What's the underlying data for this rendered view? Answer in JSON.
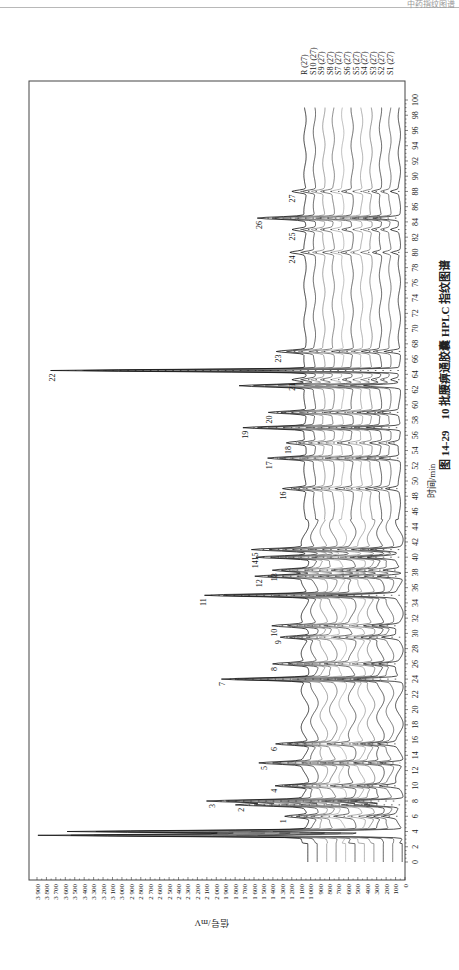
{
  "page": {
    "header_text": "中药指纹图谱"
  },
  "figure": {
    "number": "图 14-29",
    "caption": "10 批腰痹通胶囊 HPLC 指纹图谱"
  },
  "chart_data": {
    "type": "line",
    "orientation": "rotated-90-ccw",
    "title": "10 批腰痹通胶囊 HPLC 指纹图谱",
    "xlabel": "时间/min",
    "ylabel": "信号/mV",
    "xlim": [
      0,
      100
    ],
    "ylim": [
      0,
      3900
    ],
    "x_ticks": [
      0,
      2,
      4,
      6,
      8,
      10,
      12,
      14,
      16,
      18,
      20,
      22,
      24,
      26,
      28,
      30,
      32,
      34,
      36,
      38,
      40,
      42,
      44,
      46,
      48,
      50,
      52,
      54,
      56,
      58,
      60,
      62,
      64,
      66,
      68,
      70,
      72,
      74,
      76,
      78,
      80,
      82,
      84,
      86,
      88,
      90,
      92,
      94,
      96,
      98,
      100
    ],
    "y_ticks": [
      0,
      100,
      200,
      300,
      400,
      500,
      600,
      700,
      800,
      900,
      1000,
      1100,
      1200,
      1300,
      1400,
      1500,
      1600,
      1700,
      1800,
      1900,
      2000,
      2100,
      2200,
      2300,
      2400,
      2500,
      2600,
      2700,
      2800,
      2900,
      3000,
      3100,
      3200,
      3300,
      3400,
      3500,
      3600,
      3700,
      3800,
      3900
    ],
    "y_tick_labels": [
      "0",
      "100",
      "200",
      "300",
      "400",
      "500",
      "600",
      "700",
      "800",
      "900",
      "1 000",
      "1 100",
      "1 200",
      "1 300",
      "1 400",
      "1 500",
      "1 600",
      "1 700",
      "1 800",
      "1 900",
      "2 000",
      "2 100",
      "2 200",
      "2 300",
      "2 400",
      "2 500",
      "2 600",
      "2 700",
      "2 800",
      "2 900",
      "3 000",
      "3 100",
      "3 200",
      "3 300",
      "3 400",
      "3 500",
      "3 600",
      "3 700",
      "3 800",
      "3 900"
    ],
    "grid": false,
    "legend_position": "top-right (stacked trace labels)",
    "series": [
      {
        "name": "S1 (27)",
        "offset": 0
      },
      {
        "name": "S2 (27)",
        "offset": 100
      },
      {
        "name": "S3 (27)",
        "offset": 200
      },
      {
        "name": "S4 (27)",
        "offset": 300
      },
      {
        "name": "S5 (27)",
        "offset": 400
      },
      {
        "name": "S6 (27)",
        "offset": 500
      },
      {
        "name": "S7 (27)",
        "offset": 600
      },
      {
        "name": "S8 (27)",
        "offset": 700
      },
      {
        "name": "S9 (27)",
        "offset": 800
      },
      {
        "name": "S10 (27)",
        "offset": 900
      },
      {
        "name": "R (27)",
        "offset": 1000
      }
    ],
    "baseline_mV": 1000,
    "unlabeled_peaks": [
      {
        "time": 3.5,
        "height": 3800
      },
      {
        "time": 4.0,
        "height": 3500
      },
      {
        "time": 62.5,
        "height": 1700
      }
    ],
    "peaks": [
      {
        "label": "1",
        "time": 6.0,
        "height": 1250
      },
      {
        "label": "2",
        "time": 7.5,
        "height": 1700
      },
      {
        "label": "3",
        "time": 8.0,
        "height": 2000
      },
      {
        "label": "4",
        "time": 10.0,
        "height": 1350
      },
      {
        "label": "5",
        "time": 13.0,
        "height": 1450
      },
      {
        "label": "6",
        "time": 15.5,
        "height": 1350
      },
      {
        "label": "7",
        "time": 24.0,
        "height": 1900
      },
      {
        "label": "8",
        "time": 26.0,
        "height": 1350
      },
      {
        "label": "9",
        "time": 29.5,
        "height": 1300
      },
      {
        "label": "10",
        "time": 31.0,
        "height": 1350
      },
      {
        "label": "11",
        "time": 35.0,
        "height": 2100
      },
      {
        "label": "12",
        "time": 37.5,
        "height": 1500
      },
      {
        "label": "13",
        "time": 38.3,
        "height": 1350
      },
      {
        "label": "14",
        "time": 40.0,
        "height": 1550
      },
      {
        "label": "15",
        "time": 41.0,
        "height": 1550
      },
      {
        "label": "16",
        "time": 49.0,
        "height": 1250
      },
      {
        "label": "17",
        "time": 53.0,
        "height": 1400
      },
      {
        "label": "18",
        "time": 55.0,
        "height": 1200
      },
      {
        "label": "19",
        "time": 57.0,
        "height": 1650
      },
      {
        "label": "20",
        "time": 59.0,
        "height": 1400
      },
      {
        "label": "21",
        "time": 63.3,
        "height": 1150
      },
      {
        "label": "22",
        "time": 64.5,
        "height": 3700
      },
      {
        "label": "23",
        "time": 67.0,
        "height": 1300
      },
      {
        "label": "24",
        "time": 80.0,
        "height": 1150
      },
      {
        "label": "25",
        "time": 83.0,
        "height": 1150
      },
      {
        "label": "26",
        "time": 84.5,
        "height": 1500
      },
      {
        "label": "27",
        "time": 88.0,
        "height": 1150
      }
    ]
  }
}
